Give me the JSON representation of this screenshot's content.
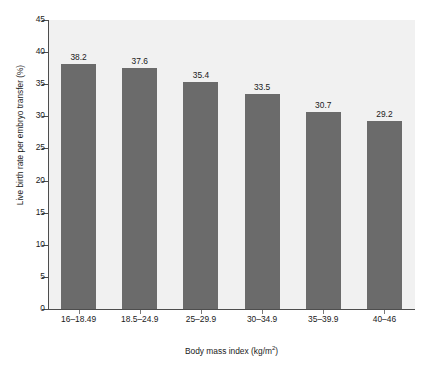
{
  "chart_data": {
    "type": "bar",
    "title": "",
    "subtitle": "",
    "categories": [
      "16–18.49",
      "18.5–24.9",
      "25–29.9",
      "30–34.9",
      "35–39.9",
      "40–46"
    ],
    "values": [
      38.2,
      37.6,
      35.4,
      33.5,
      30.7,
      29.2
    ],
    "value_labels": [
      "38.2",
      "37.6",
      "35.4",
      "33.5",
      "30.7",
      "29.2"
    ],
    "xlabel": "Body mass index (kg/m",
    "xlabel_superscript": "2",
    "xlabel_suffix": ")",
    "ylabel": "Live birth rate per embryo transfer (%)",
    "ylim": [
      0,
      45
    ],
    "ytick_values": [
      0,
      5,
      10,
      15,
      20,
      25,
      30,
      35,
      40,
      45
    ],
    "ytick_labels": [
      "0",
      "5",
      "10",
      "15",
      "20",
      "25",
      "30",
      "35",
      "40",
      "45"
    ],
    "grid": false,
    "legend": null,
    "bar_color": "#6b6b6b",
    "plot_background": "#f1f1f1",
    "axis_color": "#4d4d4d",
    "text_color": "#1a1a1a"
  }
}
